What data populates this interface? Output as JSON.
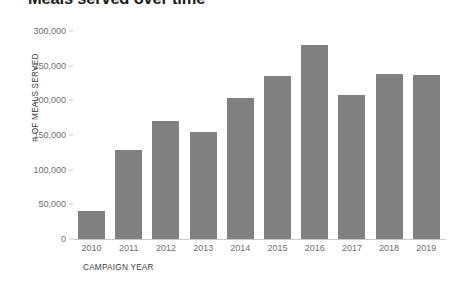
{
  "chart_data": {
    "type": "bar",
    "title": "Meals served over time",
    "xlabel": "CAMPAIGN YEAR",
    "ylabel": "# OF MEALS SERVED",
    "categories": [
      "2010",
      "2011",
      "2012",
      "2013",
      "2014",
      "2015",
      "2016",
      "2017",
      "2018",
      "2019"
    ],
    "values": [
      40000,
      128000,
      170000,
      155000,
      204000,
      235000,
      280000,
      207000,
      238000,
      237000
    ],
    "ylim": [
      0,
      300000
    ],
    "yticks": [
      0,
      50000,
      100000,
      150000,
      200000,
      250000,
      300000
    ],
    "ytick_labels": [
      "0",
      "50,000",
      "100,000",
      "150,000",
      "200,000",
      "250,000",
      "300,000"
    ],
    "grid": false,
    "legend": "none",
    "bar_color": "#808080",
    "axis_color": "#c9c9c9",
    "tick_label_color": "#6e6e6e",
    "title_color": "#1b1b1b"
  }
}
